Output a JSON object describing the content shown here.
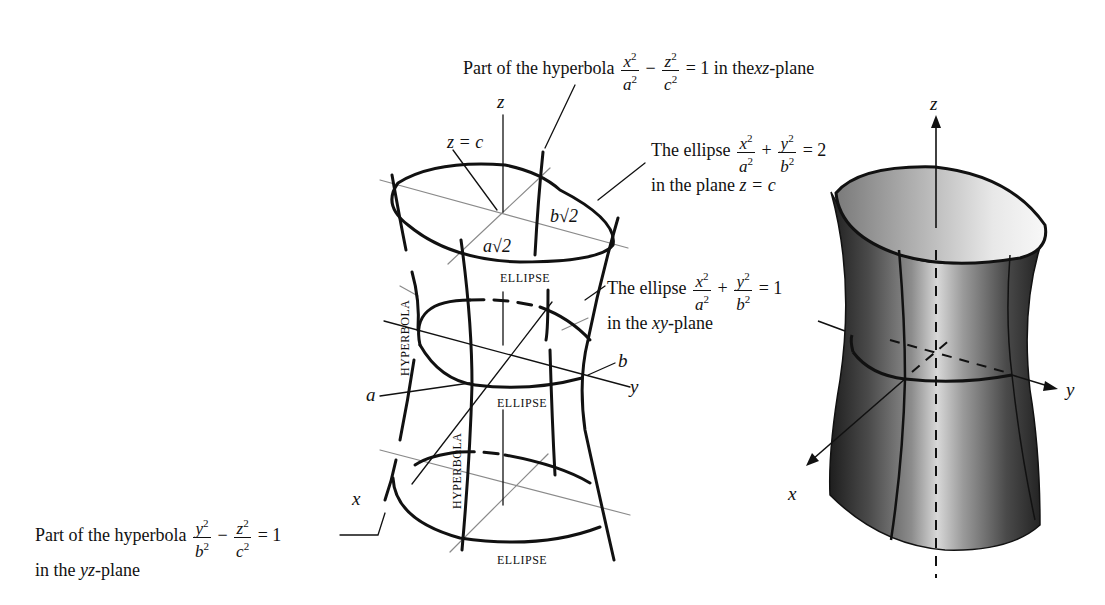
{
  "left_diagram": {
    "title": "Hyperboloid of one sheet (labeled construction)",
    "axis_labels": {
      "z": "z",
      "y": "y",
      "x": "x"
    },
    "point_labels": {
      "a": "a",
      "b": "b",
      "z_eq_c": "z = c",
      "a_sqrt2": "a√2",
      "b_sqrt2": "b√2"
    },
    "curve_labels": {
      "ellipse_top": "ELLIPSE",
      "ellipse_middle": "ELLIPSE",
      "ellipse_bottom": "ELLIPSE",
      "hyperbola_left": "HYPERBOLA",
      "hyperbola_front": "HYPERBOLA"
    }
  },
  "annotations": {
    "xz_hyperbola": {
      "prefix": "Part of the hyperbola",
      "term1_num": "x",
      "term1_den": "a",
      "op": "−",
      "term2_num": "z",
      "term2_den": "c",
      "equals": "= 1",
      "suffix_pre": "in the",
      "plane": "xz",
      "suffix_post": "-plane"
    },
    "ellipse_zc": {
      "prefix": "The ellipse",
      "term1_num": "x",
      "term1_den": "a",
      "op": "+",
      "term2_num": "y",
      "term2_den": "b",
      "equals": "= 2",
      "line2_pre": "in the plane",
      "line2_eq": "z = c"
    },
    "ellipse_xy": {
      "prefix": "The ellipse",
      "term1_num": "x",
      "term1_den": "a",
      "op": "+",
      "term2_num": "y",
      "term2_den": "b",
      "equals": "= 1",
      "line2_pre": "in the",
      "plane": "xy",
      "line2_post": "-plane"
    },
    "yz_hyperbola": {
      "prefix": "Part of the hyperbola",
      "term1_num": "y",
      "term1_den": "b",
      "op": "−",
      "term2_num": "z",
      "term2_den": "c",
      "equals": "= 1",
      "line2_pre": "in the",
      "plane": "yz",
      "line2_post": "-plane"
    },
    "exponent": "2"
  },
  "right_diagram": {
    "title": "Shaded hyperboloid surface",
    "axis_labels": {
      "z": "z",
      "y": "y",
      "x": "x"
    },
    "colors": {
      "dark": "#2a2a2a",
      "mid": "#7a7a7a",
      "light": "#e6e6e6",
      "rim": "#111111"
    }
  }
}
